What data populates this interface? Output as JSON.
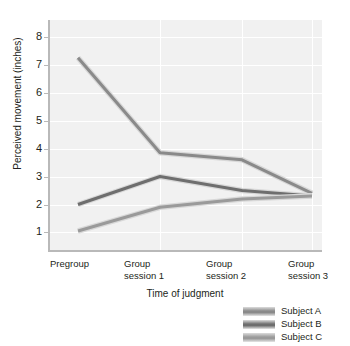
{
  "chart_data": {
    "type": "line",
    "title": "",
    "xlabel": "Time of judgment",
    "ylabel": "Perceived movement (inches)",
    "categories": [
      "Pregroup",
      "Group\nsession 1",
      "Group\nsession 2",
      "Group\nsession 3"
    ],
    "yticks": [
      1,
      2,
      3,
      4,
      5,
      6,
      7,
      8
    ],
    "ylim": [
      0.3,
      8.6
    ],
    "grid": true,
    "legend_position": "bottom-right",
    "series": [
      {
        "name": "Subject A",
        "values": [
          7.25,
          3.85,
          3.6,
          2.4
        ],
        "color": "#8a8a8a"
      },
      {
        "name": "Subject B",
        "values": [
          2.0,
          3.0,
          2.5,
          2.3
        ],
        "color": "#6e6e6e"
      },
      {
        "name": "Subject C",
        "values": [
          1.05,
          1.9,
          2.2,
          2.3
        ],
        "color": "#9a9a9a"
      }
    ]
  },
  "axes": {
    "y_title": "Perceived movement (inches)",
    "x_title": "Time of judgment",
    "y_tick_labels": [
      "8",
      "7",
      "6",
      "5",
      "4",
      "3",
      "2",
      "1"
    ],
    "x_tick_labels": [
      "Pregroup",
      "Group\nsession 1",
      "Group\nsession 2",
      "Group\nsession 3"
    ]
  },
  "legend": {
    "items": [
      {
        "label": "Subject A"
      },
      {
        "label": "Subject B"
      },
      {
        "label": "Subject C"
      }
    ]
  },
  "colors": {
    "plot_background": "#f1f1f1",
    "gridline": "#ffffff",
    "axis": "#b9b9b9",
    "text": "#231f20",
    "series_a": "#8a8a8a",
    "series_b": "#6e6e6e",
    "series_c": "#9a9a9a"
  }
}
